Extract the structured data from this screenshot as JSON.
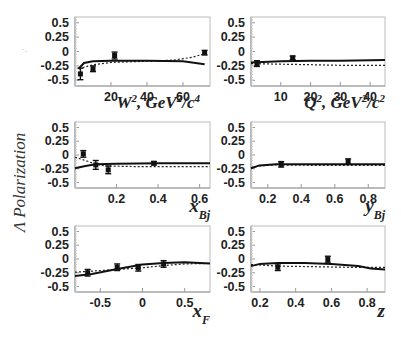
{
  "figure": {
    "ylabel": "Λ Polarization"
  },
  "chart_data": [
    {
      "type": "scatter",
      "panel": "W2",
      "xlabel": "W², GeV²/c⁴",
      "ylabel": "Λ Polarization",
      "xlim": [
        0,
        75
      ],
      "ylim": [
        -0.6,
        0.6
      ],
      "xticks": [
        20,
        40,
        60
      ],
      "yticks": [
        0.5,
        0.25,
        0,
        -0.25,
        -0.5
      ],
      "points": [
        {
          "x": 3,
          "y": -0.39,
          "err": 0.1
        },
        {
          "x": 10,
          "y": -0.3,
          "err": 0.05
        },
        {
          "x": 22,
          "y": -0.07,
          "err": 0.06
        },
        {
          "x": 72,
          "y": -0.02,
          "err": 0.04
        }
      ],
      "curve_solid": [
        [
          2,
          -0.3
        ],
        [
          5,
          -0.2
        ],
        [
          10,
          -0.17
        ],
        [
          20,
          -0.16
        ],
        [
          40,
          -0.16
        ],
        [
          60,
          -0.17
        ],
        [
          72,
          -0.22
        ]
      ],
      "curve_dotted": [
        [
          2,
          -0.3
        ],
        [
          10,
          -0.23
        ],
        [
          20,
          -0.19
        ],
        [
          40,
          -0.17
        ],
        [
          55,
          -0.15
        ],
        [
          65,
          -0.1
        ],
        [
          72,
          -0.04
        ]
      ]
    },
    {
      "type": "scatter",
      "panel": "Q2",
      "xlabel": "Q², GeV²/c²",
      "ylim": [
        -0.6,
        0.6
      ],
      "xlim": [
        0,
        45
      ],
      "xticks": [
        10,
        20,
        30,
        40
      ],
      "yticks": [
        0.5,
        0.25,
        0,
        -0.25,
        -0.5
      ],
      "points": [
        {
          "x": 2,
          "y": -0.21,
          "err": 0.05
        },
        {
          "x": 14,
          "y": -0.11,
          "err": 0.03
        }
      ],
      "curve_solid": [
        [
          0,
          -0.19
        ],
        [
          10,
          -0.17
        ],
        [
          20,
          -0.16
        ],
        [
          30,
          -0.16
        ],
        [
          45,
          -0.15
        ]
      ],
      "curve_dotted": [
        [
          0,
          -0.21
        ],
        [
          10,
          -0.22
        ],
        [
          20,
          -0.23
        ],
        [
          30,
          -0.24
        ],
        [
          45,
          -0.24
        ]
      ]
    },
    {
      "type": "scatter",
      "panel": "xBj",
      "xlabel": "x_Bj",
      "xlim": [
        0,
        0.65
      ],
      "ylim": [
        -0.6,
        0.6
      ],
      "xticks": [
        0.2,
        0.4,
        0.6
      ],
      "yticks": [
        0.5,
        0.25,
        0,
        -0.25,
        -0.5
      ],
      "points": [
        {
          "x": 0.04,
          "y": 0.02,
          "err": 0.06
        },
        {
          "x": 0.1,
          "y": -0.18,
          "err": 0.08
        },
        {
          "x": 0.16,
          "y": -0.27,
          "err": 0.07
        },
        {
          "x": 0.38,
          "y": -0.15,
          "err": 0.03
        }
      ],
      "curve_solid": [
        [
          0,
          -0.24
        ],
        [
          0.05,
          -0.2
        ],
        [
          0.1,
          -0.17
        ],
        [
          0.2,
          -0.16
        ],
        [
          0.4,
          -0.15
        ],
        [
          0.65,
          -0.15
        ]
      ],
      "curve_dotted": [
        [
          0,
          -0.04
        ],
        [
          0.05,
          -0.1
        ],
        [
          0.1,
          -0.17
        ],
        [
          0.15,
          -0.2
        ],
        [
          0.3,
          -0.21
        ],
        [
          0.65,
          -0.21
        ]
      ]
    },
    {
      "type": "scatter",
      "panel": "yBj",
      "xlabel": "y_Bj",
      "xlim": [
        0.1,
        0.9
      ],
      "ylim": [
        -0.6,
        0.6
      ],
      "xticks": [
        0.2,
        0.4,
        0.6,
        0.8
      ],
      "yticks": [
        0.5,
        0.25,
        0,
        -0.25,
        -0.5
      ],
      "points": [
        {
          "x": 0.28,
          "y": -0.17,
          "err": 0.05
        },
        {
          "x": 0.68,
          "y": -0.12,
          "err": 0.05
        }
      ],
      "curve_solid": [
        [
          0.1,
          -0.24
        ],
        [
          0.15,
          -0.19
        ],
        [
          0.25,
          -0.17
        ],
        [
          0.5,
          -0.17
        ],
        [
          0.9,
          -0.17
        ]
      ],
      "curve_dotted": [
        [
          0.1,
          -0.23
        ],
        [
          0.15,
          -0.2
        ],
        [
          0.25,
          -0.18
        ],
        [
          0.5,
          -0.19
        ],
        [
          0.9,
          -0.19
        ]
      ]
    },
    {
      "type": "scatter",
      "panel": "xF",
      "xlabel": "x_F",
      "xlim": [
        -0.8,
        0.8
      ],
      "ylim": [
        -0.6,
        0.6
      ],
      "xticks": [
        -0.5,
        0,
        0.5
      ],
      "yticks": [
        0.5,
        0.25,
        0,
        -0.25,
        -0.5
      ],
      "points": [
        {
          "x": -0.65,
          "y": -0.25,
          "err": 0.06
        },
        {
          "x": -0.3,
          "y": -0.15,
          "err": 0.06
        },
        {
          "x": -0.05,
          "y": -0.16,
          "err": 0.06
        },
        {
          "x": 0.25,
          "y": -0.09,
          "err": 0.06
        }
      ],
      "curve_solid": [
        [
          -0.8,
          -0.31
        ],
        [
          -0.6,
          -0.27
        ],
        [
          -0.3,
          -0.18
        ],
        [
          0,
          -0.1
        ],
        [
          0.25,
          -0.07
        ],
        [
          0.5,
          -0.06
        ],
        [
          0.8,
          -0.08
        ]
      ],
      "curve_dotted": [
        [
          -0.8,
          -0.24
        ],
        [
          -0.6,
          -0.22
        ],
        [
          -0.3,
          -0.19
        ],
        [
          0,
          -0.16
        ],
        [
          0.25,
          -0.12
        ],
        [
          0.5,
          -0.09
        ],
        [
          0.8,
          -0.08
        ]
      ]
    },
    {
      "type": "scatter",
      "panel": "z",
      "xlabel": "z",
      "xlim": [
        0.15,
        0.9
      ],
      "ylim": [
        -0.6,
        0.6
      ],
      "xticks": [
        0.2,
        0.4,
        0.6,
        0.8
      ],
      "yticks": [
        0.5,
        0.25,
        0,
        -0.25,
        -0.5
      ],
      "points": [
        {
          "x": 0.3,
          "y": -0.15,
          "err": 0.06
        },
        {
          "x": 0.58,
          "y": -0.01,
          "err": 0.06
        }
      ],
      "curve_solid": [
        [
          0.15,
          -0.13
        ],
        [
          0.2,
          -0.09
        ],
        [
          0.3,
          -0.07
        ],
        [
          0.45,
          -0.07
        ],
        [
          0.6,
          -0.09
        ],
        [
          0.75,
          -0.13
        ],
        [
          0.82,
          -0.17
        ],
        [
          0.9,
          -0.19
        ]
      ],
      "curve_dotted": [
        [
          0.15,
          -0.1
        ],
        [
          0.3,
          -0.13
        ],
        [
          0.5,
          -0.14
        ],
        [
          0.7,
          -0.15
        ],
        [
          0.9,
          -0.15
        ]
      ]
    }
  ]
}
